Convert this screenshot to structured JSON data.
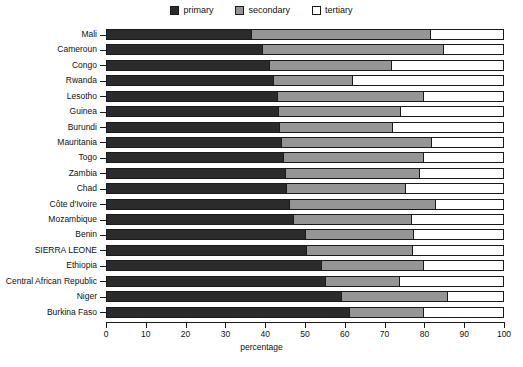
{
  "chart_data": {
    "type": "bar",
    "orientation": "horizontal",
    "stacked": true,
    "title": "",
    "xlabel": "percentage",
    "ylabel": "",
    "xlim": [
      0,
      100
    ],
    "xticks": [
      0,
      10,
      20,
      30,
      40,
      50,
      60,
      70,
      80,
      90,
      100
    ],
    "grid": false,
    "legend_position": "top-center",
    "categories": [
      "Mali",
      "Cameroun",
      "Congo",
      "Rwanda",
      "Lesotho",
      "Guinea",
      "Burundi",
      "Mauritania",
      "Togo",
      "Zambia",
      "Chad",
      "Côte d'Ivoire",
      "Mozambique",
      "Benin",
      "SIERRA LEONE",
      "Ethiopia",
      "Central African Republic",
      "Niger",
      "Burkina Faso"
    ],
    "series": [
      {
        "name": "primary",
        "color": "#2b2b2b",
        "values": [
          36.4,
          39.2,
          41.0,
          42.0,
          43.0,
          43.2,
          43.4,
          44.0,
          44.5,
          45.0,
          45.2,
          46.0,
          47.0,
          50.0,
          50.2,
          54.0,
          55.0,
          59.0,
          61.0
        ]
      },
      {
        "name": "secondary",
        "color": "#959595",
        "values": [
          45.3,
          45.8,
          31.0,
          20.0,
          37.0,
          31.0,
          28.8,
          38.0,
          35.5,
          34.0,
          30.3,
          37.0,
          30.0,
          27.5,
          27.0,
          26.0,
          19.0,
          27.0,
          19.0
        ]
      },
      {
        "name": "tertiary",
        "color": "#ffffff",
        "values": [
          18.3,
          15.0,
          28.0,
          38.0,
          20.0,
          25.8,
          27.8,
          18.0,
          20.0,
          21.0,
          24.5,
          17.0,
          23.0,
          22.5,
          22.8,
          20.0,
          26.0,
          14.0,
          20.0
        ]
      }
    ]
  },
  "legend": {
    "items": [
      {
        "label": "primary",
        "swatch": "primary"
      },
      {
        "label": "secondary",
        "swatch": "secondary"
      },
      {
        "label": "tertiary",
        "swatch": "tertiary"
      }
    ]
  },
  "axis": {
    "x_title": "percentage"
  }
}
